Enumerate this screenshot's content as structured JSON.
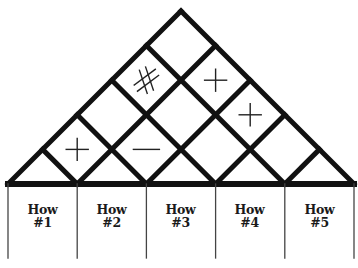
{
  "diagram": {
    "type": "house-of-quality-roof",
    "line_color": "#111111",
    "symbol_color": "#222222",
    "columns": [
      {
        "line1": "How",
        "line2": "#1"
      },
      {
        "line1": "How",
        "line2": "#2"
      },
      {
        "line1": "How",
        "line2": "#3"
      },
      {
        "line1": "How",
        "line2": "#4"
      },
      {
        "line1": "How",
        "line2": "#5"
      }
    ],
    "correlations": [
      {
        "pair": [
          1,
          2
        ],
        "symbol": "+",
        "meaning": "positive"
      },
      {
        "pair": [
          2,
          3
        ],
        "symbol": "-",
        "meaning": "negative"
      },
      {
        "pair": [
          1,
          4
        ],
        "symbol": "#",
        "meaning": "strong positive"
      },
      {
        "pair": [
          2,
          5
        ],
        "symbol": "+",
        "meaning": "positive"
      },
      {
        "pair": [
          3,
          5
        ],
        "symbol": "+",
        "meaning": "positive"
      },
      {
        "pair": [
          1,
          3
        ],
        "symbol": "",
        "meaning": "none"
      },
      {
        "pair": [
          1,
          5
        ],
        "symbol": "",
        "meaning": "none"
      },
      {
        "pair": [
          2,
          4
        ],
        "symbol": "",
        "meaning": "none"
      },
      {
        "pair": [
          3,
          4
        ],
        "symbol": "",
        "meaning": "none"
      },
      {
        "pair": [
          4,
          5
        ],
        "symbol": "",
        "meaning": "none"
      }
    ]
  }
}
